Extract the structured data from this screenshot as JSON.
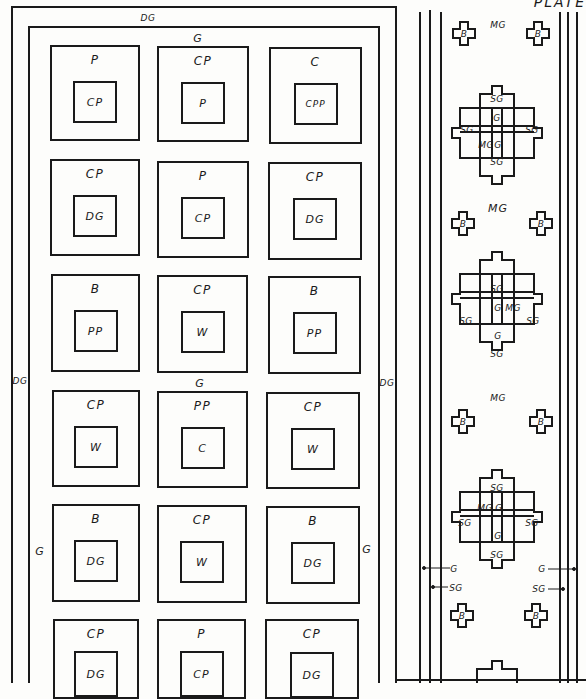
{
  "header": {
    "plate_label": "PLATE"
  },
  "borders": {
    "outer_top": "DG",
    "inner_top": "G",
    "left_side": "DG",
    "right_side": "DG",
    "middle_path": "G",
    "left_inner": "G",
    "right_inner": "G"
  },
  "plots": [
    {
      "outer": "P",
      "inner": "CP"
    },
    {
      "outer": "CP",
      "inner": "P"
    },
    {
      "outer": "C",
      "inner": "CPP"
    },
    {
      "outer": "CP",
      "inner": "DG"
    },
    {
      "outer": "P",
      "inner": "CP"
    },
    {
      "outer": "CP",
      "inner": "DG"
    },
    {
      "outer": "B",
      "inner": "PP"
    },
    {
      "outer": "CP",
      "inner": "W"
    },
    {
      "outer": "B",
      "inner": "PP"
    },
    {
      "outer": "CP",
      "inner": "W"
    },
    {
      "outer": "PP",
      "inner": "C"
    },
    {
      "outer": "CP",
      "inner": "W"
    },
    {
      "outer": "B",
      "inner": "DG"
    },
    {
      "outer": "CP",
      "inner": "W"
    },
    {
      "outer": "B",
      "inner": "DG"
    },
    {
      "outer": "CP",
      "inner": "DG"
    },
    {
      "outer": "P",
      "inner": "CP"
    },
    {
      "outer": "CP",
      "inner": "DG"
    }
  ],
  "strip": {
    "mg_labels": [
      "MG",
      "MG",
      "MG"
    ],
    "cross_label": "B",
    "motif": {
      "sg": "SG",
      "g": "G",
      "mg": "MG"
    },
    "legend": {
      "g": "G",
      "sg": "SG"
    }
  }
}
